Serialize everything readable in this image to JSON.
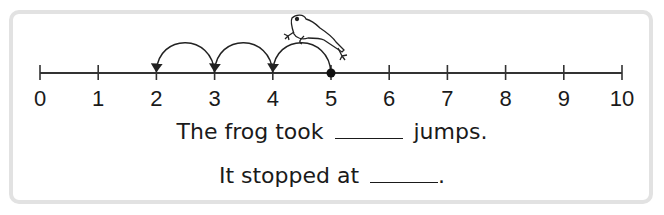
{
  "number_line": {
    "min": 0,
    "max": 10,
    "tick_labels": [
      "0",
      "1",
      "2",
      "3",
      "4",
      "5",
      "6",
      "7",
      "8",
      "9",
      "10"
    ],
    "start_point": 5,
    "jumps": [
      {
        "from": 5,
        "to": 4
      },
      {
        "from": 4,
        "to": 3
      },
      {
        "from": 3,
        "to": 2
      }
    ],
    "character": "frog"
  },
  "questions": {
    "q1_prefix": "The frog took",
    "q1_suffix": "jumps.",
    "q2_prefix": "It stopped at",
    "q2_suffix": "."
  }
}
